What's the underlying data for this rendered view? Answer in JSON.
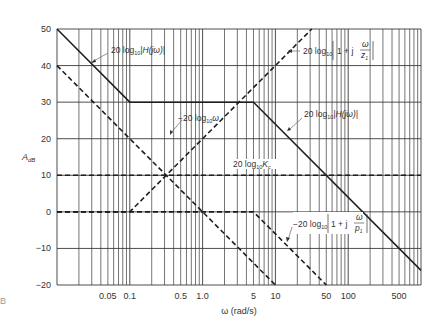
{
  "chart_data": {
    "type": "line",
    "title": "",
    "xlabel": "ω (rad/s)",
    "ylabel": "A_dB",
    "xscale": "log",
    "xlim": [
      0.01,
      1000
    ],
    "ylim": [
      -20,
      50
    ],
    "grid": true,
    "x_tick_labels": [
      "0.05",
      "0.1",
      "0.5",
      "1.0",
      "5",
      "10",
      "50",
      "100",
      "500"
    ],
    "x_tick_values": [
      0.05,
      0.1,
      0.5,
      1.0,
      5,
      10,
      50,
      100,
      500
    ],
    "y_tick_labels": [
      "50",
      "40",
      "30",
      "20",
      "10",
      "0",
      "−10",
      "−20"
    ],
    "y_tick_values": [
      50,
      40,
      30,
      20,
      10,
      0,
      -10,
      -20
    ],
    "series": [
      {
        "name": "20 log10 |H(jω)|",
        "style": "solid",
        "x": [
          0.01,
          0.1,
          5,
          1000
        ],
        "y": [
          50,
          30,
          30,
          -16
        ]
      },
      {
        "name": "−20 log10 ω",
        "style": "dashed",
        "x": [
          0.01,
          10
        ],
        "y": [
          40,
          -20
        ]
      },
      {
        "name": "20 log10 |1 + jω/z1|",
        "style": "dashed",
        "x": [
          0.01,
          0.1,
          31.6
        ],
        "y": [
          0,
          0,
          50
        ]
      },
      {
        "name": "20 log10 Kc",
        "style": "dashed",
        "x": [
          0.01,
          1000
        ],
        "y": [
          10,
          10
        ]
      },
      {
        "name": "−20 log10 |1 + jω/p1|",
        "style": "dashed",
        "x": [
          0.01,
          5,
          50
        ],
        "y": [
          0,
          0,
          -20
        ]
      }
    ],
    "annotations": [
      {
        "text": "20 log10 |H(jω)|",
        "points_to": [
          0.07,
          41
        ]
      },
      {
        "text": "−20 log10 ω",
        "points_to": [
          0.32,
          10
        ]
      },
      {
        "text": "20 log10 |1 + j ω/z1|",
        "points_to": [
          10,
          40
        ]
      },
      {
        "text": "20 log10 |H(jω)|",
        "points_to": [
          23,
          17
        ]
      },
      {
        "text": "20 log10 Kc",
        "points_to": null
      },
      {
        "text": "−20 log10 |1 + j ω/p1|",
        "points_to": [
          12.6,
          -8
        ]
      }
    ]
  },
  "labels": {
    "y_axis": "A",
    "y_axis_sub": "dB",
    "x_axis": "ω (rad/s)",
    "ann_h1_main": "20 log",
    "ann_h1_sub": "10",
    "ann_h1_rest": "|H(jω)|",
    "ann_w_main": "−20 log",
    "ann_w_sub": "10",
    "ann_w_rest": "ω",
    "ann_z_main": "20 log",
    "ann_z_sub": "10",
    "ann_z_rest": "1 + j",
    "ann_z_num": "ω",
    "ann_z_den": "z",
    "ann_z_den_sub": "1",
    "ann_h2_main": "20 log",
    "ann_h2_sub": "10",
    "ann_h2_rest": "|H(jω)|",
    "ann_k_main": "20 log",
    "ann_k_sub": "10",
    "ann_k_rest": "K",
    "ann_k_rest_sub": "c",
    "ann_p_main": "−20 log",
    "ann_p_sub": "10",
    "ann_p_rest": "1 + j",
    "ann_p_num": "ω",
    "ann_p_den": "p",
    "ann_p_den_sub": "1",
    "stray_mark": "B"
  }
}
